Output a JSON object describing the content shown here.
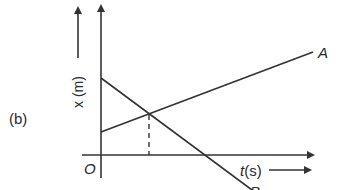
{
  "figure": {
    "panel_label": "(b)",
    "origin_label": "O",
    "y_axis_label": "x (m)",
    "x_axis_label": "t(s)",
    "lines": [
      {
        "name": "A",
        "label": "A",
        "trend": "increasing",
        "start": [
          101,
          132
        ],
        "end": [
          313,
          52
        ]
      },
      {
        "name": "B",
        "label": "B",
        "trend": "decreasing",
        "start": [
          101,
          78
        ],
        "end": [
          252,
          190
        ]
      }
    ],
    "intersection": {
      "x": 149,
      "y": 115,
      "dashed_drop_to_t_axis": true
    },
    "colors": {
      "ink": "#333333",
      "background": "#ffffff"
    }
  }
}
